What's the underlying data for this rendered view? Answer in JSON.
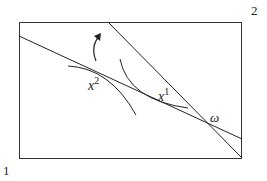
{
  "diagram": {
    "corner_labels": {
      "bottom_left": "1",
      "top_right": "2"
    },
    "points": [
      {
        "id": "x2",
        "base": "x",
        "sup": "2"
      },
      {
        "id": "x1",
        "base": "x",
        "sup": "1"
      },
      {
        "id": "omega",
        "label": "ω"
      }
    ],
    "colors": {
      "stroke": "#222222",
      "background": "#ffffff"
    }
  }
}
